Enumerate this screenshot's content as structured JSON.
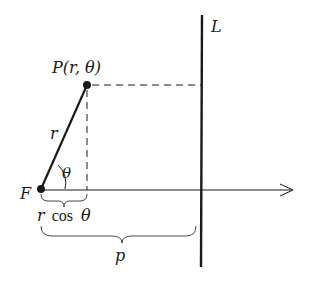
{
  "diagram": {
    "labels": {
      "line": "L",
      "point": "P(r, θ)",
      "radius": "r",
      "angle": "θ",
      "focus": "F",
      "projection_r": "r",
      "projection_cos": "cos",
      "projection_theta": "θ",
      "distance": "p"
    },
    "colors": {
      "stroke": "#1a1a1a",
      "background": "#ffffff"
    }
  }
}
